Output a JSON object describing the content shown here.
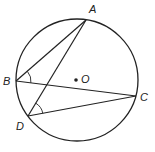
{
  "diagram": {
    "type": "circle-geometry",
    "circle": {
      "center": [
        77,
        80
      ],
      "radius": 61,
      "center_label": "O"
    },
    "points": [
      {
        "label": "A",
        "x": 86,
        "y": 20,
        "label_x": 89,
        "label_y": 13
      },
      {
        "label": "B",
        "x": 16,
        "y": 81,
        "label_x": 3,
        "label_y": 85
      },
      {
        "label": "C",
        "x": 136,
        "y": 96,
        "label_x": 140,
        "label_y": 101
      },
      {
        "label": "D",
        "x": 28,
        "y": 116,
        "label_x": 16,
        "label_y": 130
      }
    ],
    "segments": [
      "AB",
      "AD",
      "BC",
      "DC"
    ],
    "angle_marks": [
      {
        "vertex": "B",
        "between": [
          "A",
          "C"
        ]
      },
      {
        "vertex": "D",
        "between": [
          "A",
          "C"
        ]
      }
    ],
    "colors": {
      "stroke": "#222222",
      "background": "#ffffff"
    }
  },
  "labels": {
    "A": "A",
    "B": "B",
    "C": "C",
    "D": "D",
    "O": "O"
  }
}
